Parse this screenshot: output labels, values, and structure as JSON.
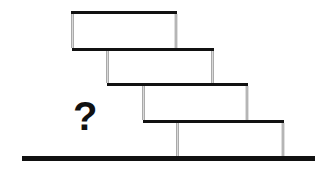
{
  "diagram": {
    "question_mark": "?",
    "colors": {
      "bar": "#111111",
      "wall": "#8a8a8a",
      "ground": "#111111",
      "background": "#ffffff"
    },
    "ground": {
      "x1": 22,
      "x2": 315,
      "y": 158.5,
      "thickness": 5
    },
    "blocks": [
      {
        "id": 1,
        "top_bar": {
          "x1": 71,
          "x2": 177,
          "y": 12.5
        },
        "left_wall_x": 72.5,
        "right_wall_x": 176,
        "wall_top": 14,
        "wall_bottom": 48
      },
      {
        "id": 2,
        "top_bar": {
          "x1": 72,
          "x2": 214,
          "y": 49.5
        },
        "left_wall_x": 107.5,
        "right_wall_x": 212.5,
        "wall_top": 51,
        "wall_bottom": 83
      },
      {
        "id": 3,
        "top_bar": {
          "x1": 107,
          "x2": 248,
          "y": 84.5
        },
        "left_wall_x": 143.5,
        "right_wall_x": 247,
        "wall_top": 86,
        "wall_bottom": 120
      },
      {
        "id": 4,
        "top_bar": {
          "x1": 143,
          "x2": 284,
          "y": 121.5
        },
        "left_wall_x": 177.5,
        "right_wall_x": 283,
        "wall_top": 123,
        "wall_bottom": 156
      }
    ]
  }
}
